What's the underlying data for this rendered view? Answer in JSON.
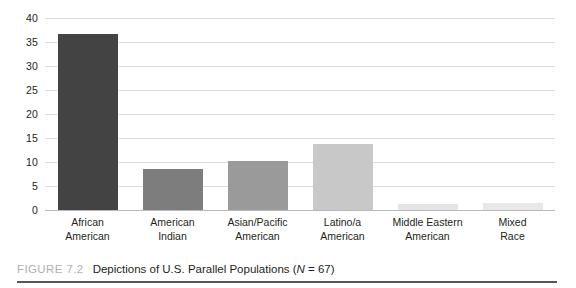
{
  "caption": {
    "figure_number": "FIGURE 7.2",
    "title_before_italic": "Depictions of U.S. Parallel Populations (",
    "title_italic": "N",
    "title_after_italic": " = 67)",
    "full_title": "Depictions of U.S. Parallel Populations (N = 67)"
  },
  "chart_data": {
    "type": "bar",
    "title": "Depictions of U.S. Parallel Populations (N = 67)",
    "xlabel": "",
    "ylabel": "",
    "categories": [
      "African American",
      "American Indian",
      "Asian/Pacific American",
      "Latino/a American",
      "Middle Eastern American",
      "Mixed Race"
    ],
    "category_lines": [
      [
        "African",
        "American"
      ],
      [
        "American",
        "Indian"
      ],
      [
        "Asian/Pacific",
        "American"
      ],
      [
        "Latino/a",
        "American"
      ],
      [
        "Middle Eastern",
        "American"
      ],
      [
        "Mixed",
        "Race"
      ]
    ],
    "values": [
      36.7,
      8.6,
      10.3,
      13.7,
      1.2,
      1.5
    ],
    "bar_colors": [
      "#434343",
      "#7d7d7d",
      "#9a9a9a",
      "#c8c8c8",
      "#e4e4e4",
      "#e8e8e8"
    ],
    "ylim": [
      0,
      40
    ],
    "yticks": [
      0,
      5,
      10,
      15,
      20,
      25,
      30,
      35,
      40
    ],
    "ytick_labels": [
      "0",
      "5",
      "10",
      "15",
      "20",
      "25",
      "30",
      "35",
      "40"
    ],
    "grid": true,
    "grid_axis": "y",
    "legend": "none",
    "gridline_color": "#dcdcdc",
    "baseline_color": "#b9b9b9",
    "background": "#ffffff"
  }
}
